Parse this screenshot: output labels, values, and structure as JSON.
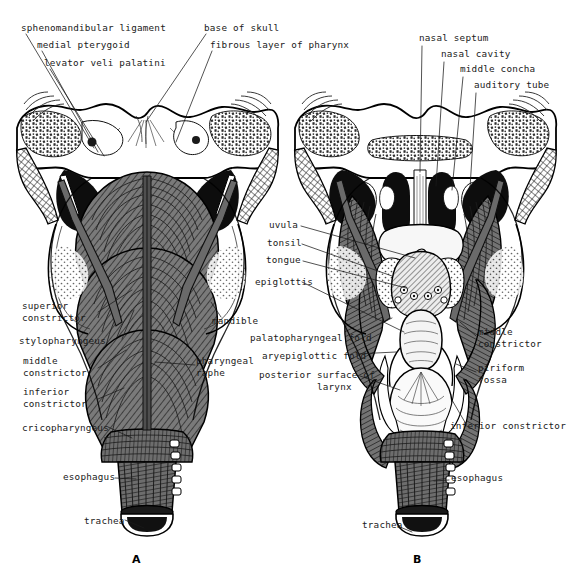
{
  "figure": {
    "background": "#ffffff",
    "ink": "#1a1a1a",
    "panels": [
      {
        "id": "A",
        "letter": "A",
        "x": 136,
        "y": 553
      },
      {
        "id": "B",
        "letter": "B",
        "x": 417,
        "y": 553
      }
    ]
  },
  "labels": {
    "a_top": [
      {
        "name": "sphenomandibular-ligament",
        "text": "sphenomandibular ligament",
        "x": 21,
        "y": 28,
        "align": "left"
      },
      {
        "name": "medial-pterygoid",
        "text": "medial pterygoid",
        "x": 37,
        "y": 45,
        "align": "left"
      },
      {
        "name": "levator-veli-palatini",
        "text": "levator veli palatini",
        "x": 44,
        "y": 63,
        "align": "left"
      },
      {
        "name": "base-of-skull",
        "text": "base of skull",
        "x": 204,
        "y": 28,
        "align": "left"
      },
      {
        "name": "fibrous-layer-of-pharynx",
        "text": "fibrous layer of pharynx",
        "x": 210,
        "y": 45,
        "align": "left"
      }
    ],
    "b_top": [
      {
        "name": "nasal-septum",
        "text": "nasal septum",
        "x": 419,
        "y": 38,
        "align": "left"
      },
      {
        "name": "nasal-cavity",
        "text": "nasal cavity",
        "x": 441,
        "y": 54,
        "align": "left"
      },
      {
        "name": "middle-concha",
        "text": "middle concha",
        "x": 460,
        "y": 69,
        "align": "left"
      },
      {
        "name": "auditory-tube",
        "text": "auditory tube",
        "x": 474,
        "y": 85,
        "align": "left"
      }
    ],
    "a_left": [
      {
        "name": "superior-constrictor",
        "text": "superior\nconstrictor",
        "x": 22,
        "y": 306,
        "align": "left"
      },
      {
        "name": "stylopharyngeus",
        "text": "stylopharyngeus",
        "x": 19,
        "y": 341,
        "align": "left"
      },
      {
        "name": "middle-constrictor",
        "text": "middle\nconstrictor",
        "x": 23,
        "y": 361,
        "align": "left"
      },
      {
        "name": "inferior-constrictor",
        "text": "inferior\nconstrictor",
        "x": 23,
        "y": 392,
        "align": "left"
      },
      {
        "name": "cricopharyngeus",
        "text": "cricopharyngeus",
        "x": 22,
        "y": 428,
        "align": "left"
      },
      {
        "name": "esophagus-a",
        "text": "esophagus",
        "x": 63,
        "y": 477,
        "align": "left"
      },
      {
        "name": "trachea-a",
        "text": "trachea",
        "x": 84,
        "y": 521,
        "align": "left"
      }
    ],
    "a_right": [
      {
        "name": "mandible",
        "text": "mandible",
        "x": 212,
        "y": 321,
        "align": "left"
      },
      {
        "name": "pharyngeal-raphe",
        "text": "pharyngeal\nraphe",
        "x": 196,
        "y": 361,
        "align": "left"
      }
    ],
    "b_left": [
      {
        "name": "uvula",
        "text": "uvula",
        "x": 269,
        "y": 225,
        "align": "left"
      },
      {
        "name": "tonsil",
        "text": "tonsil",
        "x": 267,
        "y": 243,
        "align": "left"
      },
      {
        "name": "tongue",
        "text": "tongue",
        "x": 266,
        "y": 260,
        "align": "left"
      },
      {
        "name": "epiglottis",
        "text": "epiglottis",
        "x": 255,
        "y": 283,
        "align": "left"
      },
      {
        "name": "palatopharyngeal-fold",
        "text": "palatopharyngeal fold",
        "x": 250,
        "y": 338,
        "align": "left"
      },
      {
        "name": "aryepiglottic-fold",
        "text": "aryepiglottic fold",
        "x": 262,
        "y": 356,
        "align": "left"
      },
      {
        "name": "posterior-surface-of-larynx",
        "text": "posterior surface of\n          larynx",
        "x": 259,
        "y": 375,
        "align": "left"
      },
      {
        "name": "trachea-b",
        "text": "trachea",
        "x": 362,
        "y": 525,
        "align": "left"
      }
    ],
    "b_right": [
      {
        "name": "middle-constrictor-b",
        "text": "middle\nconstrictor",
        "x": 478,
        "y": 332,
        "align": "left"
      },
      {
        "name": "piriform-fossa",
        "text": "piriform\nfossa",
        "x": 478,
        "y": 368,
        "align": "left"
      },
      {
        "name": "inferior-constrictor-b",
        "text": "inferior constrictor",
        "x": 450,
        "y": 426,
        "align": "left"
      },
      {
        "name": "esophagus-b",
        "text": "esophagus",
        "x": 451,
        "y": 478,
        "align": "left"
      }
    ]
  },
  "graphic": {
    "leader_color": "#1a1a1a",
    "leader_width": 0.7,
    "outline_color": "#000000",
    "muscle_fill": "#6e6e6e",
    "muscle_fill_dark": "#575757",
    "bone_fill": "#ffffff",
    "cavity_fill": "#0d0d0d",
    "mucosa_fill": "#f2f2f2",
    "stipple_fill": "#c9c9c9"
  }
}
